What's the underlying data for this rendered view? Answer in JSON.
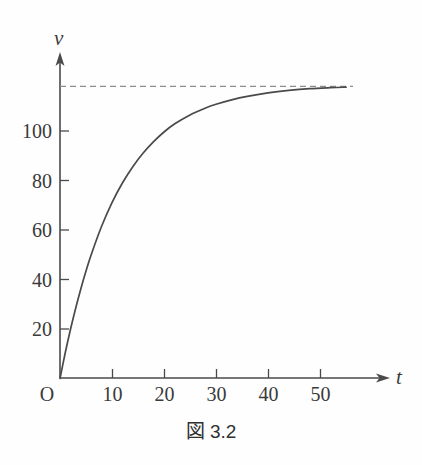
{
  "figure": {
    "caption": "図 3.2",
    "background_color": "#fefefe",
    "curve_color": "#4a4a4a",
    "asymptote_color": "#8d8d8d",
    "axis_color": "#4a4a4a"
  },
  "axes": {
    "x_name": "t",
    "y_name": "v",
    "origin_label": "O"
  },
  "chart_data": {
    "type": "line",
    "title": "図 3.2",
    "xlabel": "t",
    "ylabel": "v",
    "xlim": [
      0,
      60
    ],
    "ylim": [
      0,
      126
    ],
    "grid": false,
    "legend": false,
    "x_ticks": [
      10,
      20,
      30,
      40,
      50
    ],
    "x_tick_labels": [
      "10",
      "20",
      "30",
      "40",
      "50"
    ],
    "y_ticks": [
      20,
      40,
      60,
      80,
      100
    ],
    "y_tick_labels": [
      "20",
      "40",
      "60",
      "80",
      "100"
    ],
    "annotations": [
      {
        "name": "asymptote",
        "type": "horizontal-dashed-line",
        "value": 118,
        "x_start": 0,
        "x_end": 55
      }
    ],
    "series": [
      {
        "name": "v(t)",
        "style": "solid",
        "x": [
          0,
          1,
          2,
          3,
          4,
          5,
          6,
          8,
          10,
          12,
          14,
          16,
          18,
          20,
          22,
          25,
          28,
          30,
          33,
          36,
          40,
          44,
          48,
          52,
          55
        ],
        "values": [
          0,
          10.3,
          19.7,
          28.3,
          36.2,
          43.4,
          50.0,
          61.5,
          71.1,
          79.0,
          85.6,
          91.1,
          95.7,
          99.6,
          102.8,
          106.5,
          109.3,
          110.8,
          112.6,
          114.0,
          115.4,
          116.4,
          117.1,
          117.5,
          117.7
        ]
      }
    ]
  }
}
